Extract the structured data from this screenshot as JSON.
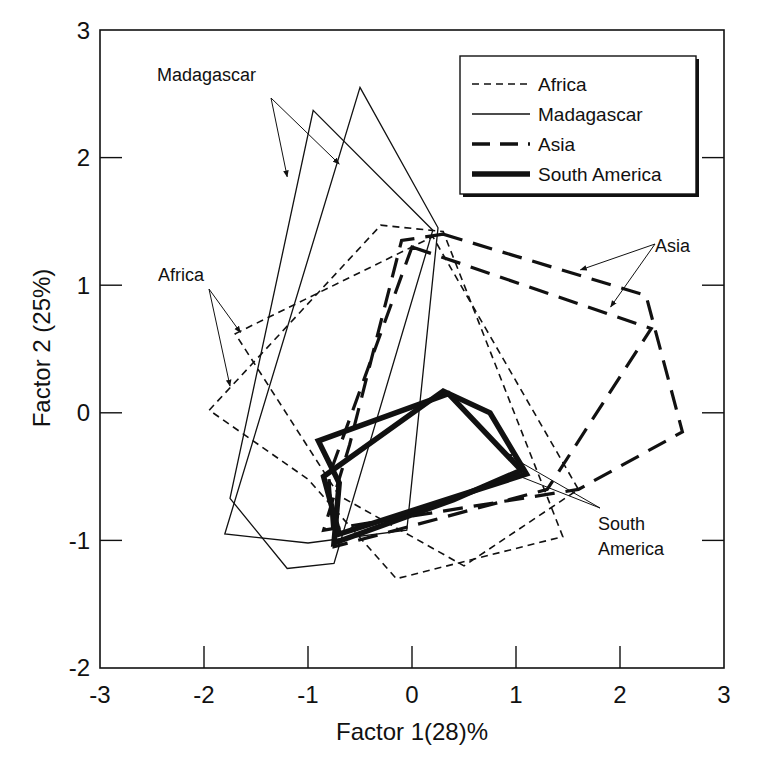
{
  "chart_data": {
    "type": "line",
    "subtype": "polygon-outlines (factor score convex hulls)",
    "title": "",
    "xlabel": "Factor 1(28)%",
    "ylabel": "Factor 2 (25%)",
    "xlim": [
      -3,
      3
    ],
    "ylim": [
      -2,
      3
    ],
    "xticks": [
      -3,
      -2,
      -1,
      0,
      1,
      2,
      3
    ],
    "yticks": [
      -2,
      -1,
      0,
      1,
      2,
      3
    ],
    "xtick_labels": [
      "-3",
      "-2",
      "-1",
      "0",
      "1",
      "2",
      "3"
    ],
    "ytick_labels": [
      "-2",
      "-1",
      "0",
      "1",
      "2",
      "3"
    ],
    "grid": false,
    "legend_position": "upper right (inside)",
    "legend": [
      {
        "label": "Africa",
        "style": "thin-dashed"
      },
      {
        "label": "Madagascar",
        "style": "thin-solid"
      },
      {
        "label": "Asia",
        "style": "thick-dashed"
      },
      {
        "label": "South America",
        "style": "thick-solid"
      }
    ],
    "series": [
      {
        "name": "Africa",
        "style": "thin-dashed",
        "polygon": 1,
        "points": [
          [
            -1.7,
            0.62
          ],
          [
            0.2,
            1.38
          ],
          [
            1.6,
            -0.6
          ],
          [
            0.5,
            -1.2
          ],
          [
            -0.7,
            -0.65
          ]
        ]
      },
      {
        "name": "Africa",
        "style": "thin-dashed",
        "polygon": 2,
        "points": [
          [
            -1.95,
            0.02
          ],
          [
            -0.3,
            1.47
          ],
          [
            0.3,
            1.42
          ],
          [
            1.45,
            -0.97
          ],
          [
            -0.15,
            -1.3
          ],
          [
            -1.0,
            -0.52
          ]
        ]
      },
      {
        "name": "Madagascar",
        "style": "thin-solid",
        "polygon": 1,
        "points": [
          [
            -0.95,
            2.37
          ],
          [
            0.2,
            1.43
          ],
          [
            -0.75,
            -1.18
          ],
          [
            -1.2,
            -1.22
          ],
          [
            -1.75,
            -0.67
          ]
        ]
      },
      {
        "name": "Madagascar",
        "style": "thin-solid",
        "polygon": 2,
        "points": [
          [
            -0.5,
            2.55
          ],
          [
            0.25,
            1.45
          ],
          [
            -0.05,
            -0.92
          ],
          [
            -1.0,
            -1.02
          ],
          [
            -1.8,
            -0.95
          ]
        ]
      },
      {
        "name": "Asia",
        "style": "thick-dashed",
        "polygon": 1,
        "points": [
          [
            0.3,
            1.4
          ],
          [
            2.25,
            0.92
          ],
          [
            2.6,
            -0.15
          ],
          [
            1.6,
            -0.6
          ],
          [
            -0.85,
            -0.92
          ],
          [
            -0.6,
            -0.25
          ],
          [
            -0.1,
            1.35
          ]
        ]
      },
      {
        "name": "Asia",
        "style": "thick-dashed",
        "polygon": 2,
        "points": [
          [
            0.0,
            1.3
          ],
          [
            2.3,
            0.66
          ],
          [
            1.3,
            -0.6
          ],
          [
            -0.75,
            -1.05
          ],
          [
            -0.8,
            -0.5
          ]
        ]
      },
      {
        "name": "South America",
        "style": "thick-solid",
        "polygon": 1,
        "points": [
          [
            -0.9,
            -0.22
          ],
          [
            0.35,
            0.15
          ],
          [
            1.05,
            -0.45
          ],
          [
            0.4,
            -0.68
          ],
          [
            -0.75,
            -1.02
          ],
          [
            -0.7,
            -0.55
          ]
        ]
      },
      {
        "name": "South America",
        "style": "thick-solid",
        "polygon": 2,
        "points": [
          [
            -0.85,
            -0.5
          ],
          [
            0.3,
            0.17
          ],
          [
            0.75,
            0.0
          ],
          [
            1.1,
            -0.48
          ],
          [
            -0.7,
            -0.95
          ]
        ]
      }
    ],
    "annotations": [
      {
        "text": "Madagascar",
        "x": -1.95,
        "y": 2.2,
        "arrows_to": [
          [
            -1.2,
            1.85
          ],
          [
            -0.7,
            1.95
          ]
        ]
      },
      {
        "text": "Africa",
        "x": -2.15,
        "y": 1.05,
        "arrows_to": [
          [
            -1.65,
            0.63
          ],
          [
            -1.75,
            0.21
          ]
        ]
      },
      {
        "text": "Asia",
        "x": 2.35,
        "y": 1.15,
        "arrows_to": [
          [
            1.62,
            1.12
          ],
          [
            1.91,
            0.83
          ]
        ]
      },
      {
        "text": "South America",
        "x": 1.85,
        "y": -1.05,
        "arrows_to": [
          [
            0.9,
            -0.32
          ],
          [
            0.98,
            -0.48
          ]
        ]
      }
    ]
  },
  "annotations_text": {
    "madagascar": "Madagascar",
    "africa": "Africa",
    "asia": "Asia",
    "south_america_line1": "South",
    "south_america_line2": "America"
  },
  "legend_labels": {
    "africa": "Africa",
    "madagascar": "Madagascar",
    "asia": "Asia",
    "south_america": "South America"
  },
  "axes": {
    "xlabel": "Factor 1(28)%",
    "ylabel": "Factor 2 (25%)",
    "xtick_labels": [
      "-3",
      "-2",
      "-1",
      "0",
      "1",
      "2",
      "3"
    ],
    "ytick_labels": [
      "-2",
      "-1",
      "0",
      "1",
      "2",
      "3"
    ]
  },
  "colors": {
    "ink": "#111111",
    "background": "#ffffff"
  }
}
